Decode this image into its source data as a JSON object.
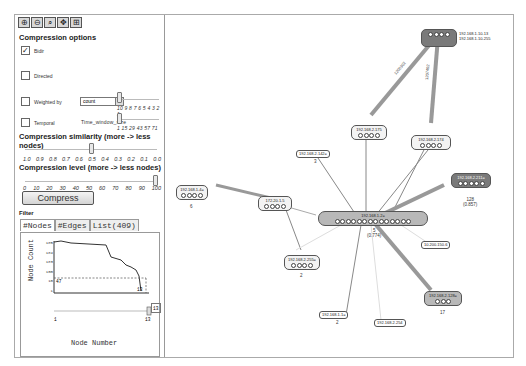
{
  "toolbar": {
    "icons": [
      "zoom-in-icon",
      "zoom-out-icon",
      "zoom-fit-icon",
      "layout-icon",
      "settings-icon"
    ],
    "glyphs": [
      "⊕",
      "⊖",
      "⌕",
      "✥",
      "⊞"
    ]
  },
  "compression_options": {
    "title": "Compression options",
    "options": [
      {
        "label": "Bidir",
        "checked": true
      },
      {
        "label": "Directed",
        "checked": false
      },
      {
        "label": "Weighted by",
        "checked": false
      },
      {
        "label": "Temporal",
        "checked": false
      }
    ],
    "weighted_select": "count",
    "weighted_scale": "10 9 8 7 6 5 4 3 2 1",
    "temporal_field": "Time_window_size",
    "temporal_scale": "1  15 29 43 57 71"
  },
  "similarity": {
    "title": "Compression similarity (more -> less nodes)",
    "ticks": [
      "1.0",
      "0.9",
      "0.8",
      "0.7",
      "0.6",
      "0.5",
      "0.4",
      "0.3",
      "0.2",
      "0.1",
      "0.0"
    ],
    "value": "0.5"
  },
  "level": {
    "title": "Compression level (more -> less nodes)",
    "ticks": [
      "0",
      "10",
      "20",
      "30",
      "40",
      "50",
      "60",
      "70",
      "80",
      "90",
      "100"
    ],
    "value": "100"
  },
  "compress_button": "Compress",
  "filter": {
    "title": "Filter",
    "tabs": [
      "#Nodes",
      "#Edges",
      "List(409)"
    ],
    "active_tab": "#Nodes",
    "chart": {
      "ylabel": "Node Count",
      "xlabel": "Node Number",
      "yticks": [
        "1e5",
        "1e4",
        "1e3",
        "100",
        "10",
        "1"
      ],
      "threshold_label": "47",
      "marker_label": "13",
      "slider_min": "1",
      "slider_max": "13",
      "input_value": "13"
    }
  },
  "graph": {
    "nodes": [
      {
        "id": "top-right",
        "label": "192.168.1.10-13",
        "label2": "192.168.1.10-255",
        "style": "dark"
      },
      {
        "id": "n175",
        "label": "192.168.2.175"
      },
      {
        "id": "n174",
        "label": "192.168.2.174"
      },
      {
        "id": "n142",
        "label": "192.168.2.142=",
        "count": "3"
      },
      {
        "id": "n211",
        "label": "192.168.2.211=",
        "count": "128",
        "ratio": "(0.857)",
        "style": "dark"
      },
      {
        "id": "n4",
        "label": "192.168.1.4=",
        "count": "6"
      },
      {
        "id": "n172",
        "label": "172.20.1.5"
      },
      {
        "id": "center",
        "label": "192.168.1.2=",
        "count": "5",
        "ratio": "(0.774)"
      },
      {
        "id": "n255",
        "label": "192.168.2.255=",
        "count": "2"
      },
      {
        "id": "n10200",
        "label": "10.200.150.6"
      },
      {
        "id": "n128",
        "label": "192.168.2.128=",
        "count": "17",
        "style": "mid"
      },
      {
        "id": "n11",
        "label": "192.168.1.1=",
        "count": "2"
      },
      {
        "id": "n254",
        "label": "192.168.2.254"
      }
    ],
    "edge_labels": [
      "1200302",
      "1207402"
    ]
  }
}
